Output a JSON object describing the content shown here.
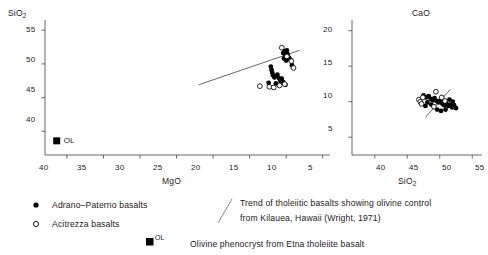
{
  "chart_data": [
    {
      "id": "sio2-vs-mgo",
      "type": "scatter",
      "title": "",
      "xlabel": "MgO",
      "ylabel": "SiO2",
      "ylabel_display": "SiO",
      "ylabel_sub": "2",
      "xlim": [
        43,
        4
      ],
      "ylim": [
        36.5,
        56.5
      ],
      "x_reversed": true,
      "xticks": [
        40,
        35,
        30,
        25,
        20,
        15,
        10,
        5
      ],
      "yticks": [
        55,
        50,
        45,
        40
      ],
      "grid": false,
      "series": [
        {
          "name": "Adrano-Paterno basalts",
          "marker": "filled-circle",
          "points": [
            [
              10.4,
              51.6
            ],
            [
              10.2,
              51.9
            ],
            [
              10.1,
              51.3
            ],
            [
              10.0,
              51.7
            ],
            [
              9.8,
              51.4
            ],
            [
              9.9,
              52.0
            ],
            [
              9.7,
              51.0
            ],
            [
              10.3,
              50.8
            ],
            [
              10.0,
              50.5
            ],
            [
              9.6,
              50.9
            ],
            [
              9.4,
              50.6
            ],
            [
              12.1,
              49.6
            ],
            [
              12.0,
              49.1
            ],
            [
              11.9,
              48.7
            ],
            [
              11.8,
              48.3
            ],
            [
              11.6,
              48.0
            ],
            [
              11.2,
              48.4
            ],
            [
              11.0,
              47.9
            ],
            [
              10.8,
              47.5
            ],
            [
              10.6,
              47.8
            ],
            [
              10.4,
              47.3
            ],
            [
              11.4,
              47.1
            ],
            [
              9.2,
              49.8
            ],
            [
              12.4,
              47.2
            ],
            [
              10.1,
              46.9
            ]
          ]
        },
        {
          "name": "Acitrezza basalts",
          "marker": "open-circle",
          "points": [
            [
              10.6,
              52.4
            ],
            [
              9.3,
              50.4
            ],
            [
              9.0,
              49.4
            ],
            [
              10.9,
              46.8
            ],
            [
              12.3,
              46.6
            ],
            [
              13.6,
              46.7
            ],
            [
              11.7,
              46.5
            ],
            [
              10.2,
              47.0
            ],
            [
              9.9,
              51.1
            ]
          ]
        }
      ],
      "reference_line": {
        "name": "Kilauea olivine-control trend",
        "x1": 22.0,
        "y1": 46.9,
        "x2": 8.2,
        "y2": 52.0
      },
      "special_markers": [
        {
          "name": "olivine-phenocryst",
          "label": "OL",
          "marker": "filled-square",
          "x": 41.4,
          "y": 38.6
        }
      ]
    },
    {
      "id": "cao-vs-sio2",
      "type": "scatter",
      "title": "",
      "xlabel": "SiO2",
      "xlabel_display": "SiO",
      "xlabel_sub": "2",
      "ylabel": "CaO",
      "xlim": [
        36.5,
        56.5
      ],
      "ylim": [
        2.5,
        21.5
      ],
      "x_reversed": false,
      "xticks": [
        40,
        45,
        50,
        55
      ],
      "yticks": [
        20,
        15,
        10,
        5
      ],
      "grid": false,
      "series": [
        {
          "name": "Adrano-Paterno basalts",
          "marker": "filled-circle",
          "points": [
            [
              47.5,
              10.9
            ],
            [
              47.9,
              10.6
            ],
            [
              48.3,
              10.8
            ],
            [
              48.6,
              10.4
            ],
            [
              48.9,
              10.2
            ],
            [
              49.2,
              10.5
            ],
            [
              49.5,
              10.1
            ],
            [
              49.8,
              9.9
            ],
            [
              50.1,
              10.2
            ],
            [
              50.4,
              9.7
            ],
            [
              50.7,
              9.5
            ],
            [
              51.0,
              9.8
            ],
            [
              51.3,
              9.4
            ],
            [
              51.6,
              9.6
            ],
            [
              51.9,
              9.2
            ],
            [
              52.2,
              9.5
            ],
            [
              52.5,
              9.1
            ],
            [
              50.9,
              8.9
            ],
            [
              50.2,
              8.7
            ],
            [
              49.6,
              8.9
            ],
            [
              48.7,
              9.6
            ],
            [
              48.1,
              9.9
            ],
            [
              47.8,
              9.4
            ],
            [
              51.5,
              10.3
            ],
            [
              52.0,
              10.0
            ]
          ]
        },
        {
          "name": "Acitrezza basalts",
          "marker": "open-circle",
          "points": [
            [
              46.8,
              10.3
            ],
            [
              47.0,
              10.0
            ],
            [
              47.2,
              9.7
            ],
            [
              47.4,
              10.6
            ],
            [
              49.4,
              11.4
            ],
            [
              50.3,
              10.6
            ],
            [
              50.8,
              10.1
            ],
            [
              49.1,
              9.3
            ]
          ]
        }
      ],
      "reference_line": {
        "name": "Kilauea olivine-control trend",
        "x1": 47.8,
        "y1": 7.8,
        "x2": 51.6,
        "y2": 11.7
      },
      "special_markers": []
    }
  ],
  "legend": {
    "entries": [
      {
        "marker": "filled-circle",
        "label": "Adrano–Paterno basalts"
      },
      {
        "marker": "open-circle",
        "label": "Acitrezza basalts"
      },
      {
        "marker": "filled-square",
        "marker_label": "OL",
        "label": "Olivine phenocryst from Etna tholeiite basalt"
      }
    ],
    "annotation": {
      "line1": "Trend of tholeiitic basalts showing olivine control",
      "line2": "from Kilauea, Hawaii (Wright, 1971)"
    }
  },
  "style": {
    "axis_color": "#555555",
    "marker_color": "#000000",
    "line_color": "#555555",
    "background": "#ffffff"
  }
}
